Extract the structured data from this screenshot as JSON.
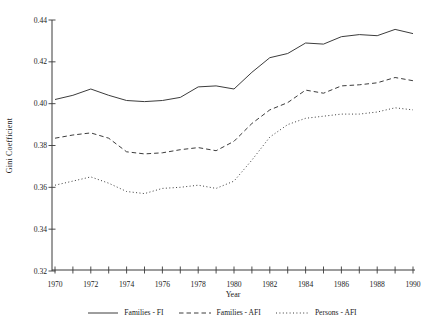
{
  "chart_data": {
    "type": "line",
    "title": "",
    "xlabel": "Year",
    "ylabel": "Gini Coefficient",
    "x": [
      1970,
      1971,
      1972,
      1973,
      1974,
      1975,
      1976,
      1977,
      1978,
      1979,
      1980,
      1981,
      1982,
      1983,
      1984,
      1985,
      1986,
      1987,
      1988,
      1989,
      1990
    ],
    "series": [
      {
        "name": "Families - FI",
        "style": "solid",
        "values": [
          0.402,
          0.404,
          0.407,
          0.404,
          0.4015,
          0.401,
          0.4015,
          0.403,
          0.408,
          0.4085,
          0.407,
          0.415,
          0.422,
          0.424,
          0.429,
          0.4285,
          0.432,
          0.433,
          0.4325,
          0.4355,
          0.4335
        ]
      },
      {
        "name": "Families - AFI",
        "style": "dashed",
        "values": [
          0.3835,
          0.385,
          0.386,
          0.3835,
          0.377,
          0.376,
          0.3765,
          0.378,
          0.379,
          0.3775,
          0.382,
          0.3905,
          0.397,
          0.4005,
          0.4065,
          0.405,
          0.4085,
          0.409,
          0.41,
          0.4125,
          0.411
        ]
      },
      {
        "name": "Persons - AFI",
        "style": "dotted",
        "values": [
          0.361,
          0.363,
          0.365,
          0.362,
          0.358,
          0.357,
          0.3595,
          0.36,
          0.361,
          0.3595,
          0.363,
          0.373,
          0.384,
          0.39,
          0.393,
          0.394,
          0.395,
          0.395,
          0.396,
          0.398,
          0.397
        ]
      }
    ],
    "ylim": [
      0.32,
      0.44
    ],
    "xlim": [
      1970,
      1990
    ],
    "yticks": [
      0.32,
      0.34,
      0.36,
      0.38,
      0.4,
      0.42,
      0.44
    ],
    "xticks_labeled": [
      1970,
      1972,
      1974,
      1976,
      1978,
      1980,
      1982,
      1984,
      1986,
      1988,
      1990
    ],
    "xticks_minor_every_year": true,
    "grid": false,
    "legend_position": "bottom",
    "line_color": "#3c3c3c",
    "background": "#ffffff"
  }
}
